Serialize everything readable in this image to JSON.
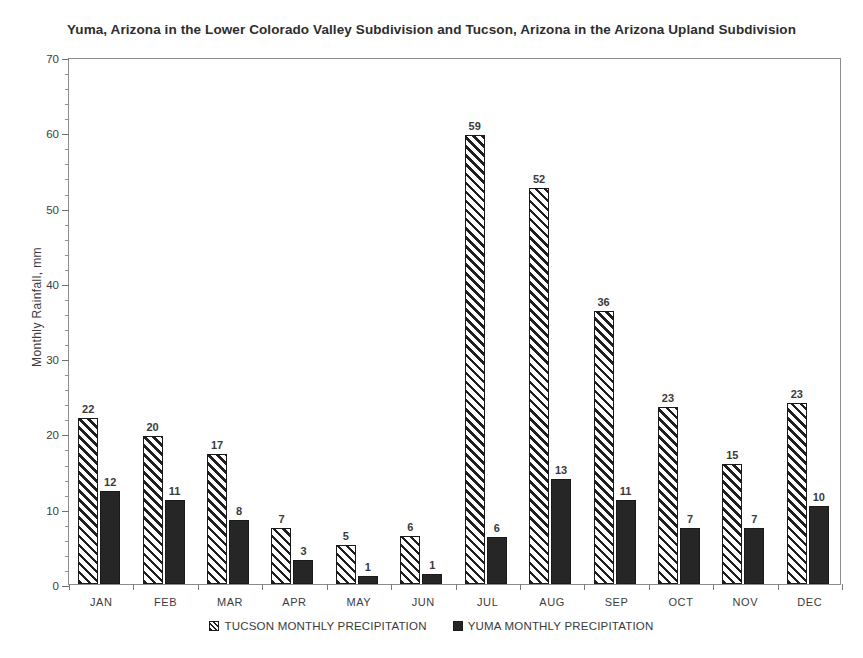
{
  "chart_data": {
    "type": "bar",
    "title": "Yuma, Arizona in the Lower Colorado Valley Subdivision and Tucson, Arizona in the Arizona Upland Subdivision",
    "xlabel": "",
    "ylabel": "Monthly Rainfall, mm",
    "ylim": [
      0,
      70
    ],
    "y_major_ticks": [
      0,
      10,
      20,
      30,
      40,
      50,
      60,
      70
    ],
    "y_minor_tick_step": 2,
    "grid": false,
    "legend_position": "bottom",
    "categories": [
      "JAN",
      "FEB",
      "MAR",
      "APR",
      "MAY",
      "JUN",
      "JUL",
      "AUG",
      "SEP",
      "OCT",
      "NOV",
      "DEC"
    ],
    "series": [
      {
        "name": "TUCSON MONTHLY PRECIPITATION",
        "fill": "diagonal-hatch",
        "color": "#1f1f1f",
        "labels": [
          "22",
          "20",
          "17",
          "7",
          "5",
          "6",
          "59",
          "52",
          "36",
          "23",
          "15",
          "23"
        ],
        "values": [
          22.1,
          19.7,
          17.3,
          7.4,
          5.2,
          6.4,
          59.6,
          52.6,
          36.2,
          23.5,
          16.0,
          24.1
        ]
      },
      {
        "name": "YUMA MONTHLY PRECIPITATION",
        "fill": "solid",
        "color": "#262626",
        "labels": [
          "12",
          "11",
          "8",
          "3",
          "1",
          "1",
          "6",
          "13",
          "11",
          "7",
          "7",
          "10"
        ],
        "values": [
          12.4,
          11.1,
          8.5,
          3.2,
          1.1,
          1.3,
          6.3,
          13.9,
          11.2,
          7.5,
          7.4,
          10.3
        ]
      }
    ]
  }
}
